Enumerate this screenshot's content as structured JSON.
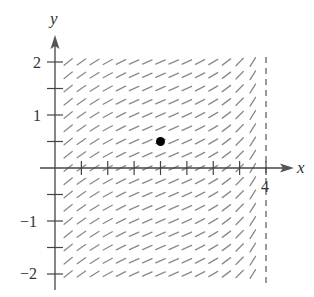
{
  "chart_data": {
    "type": "slope_field",
    "title": "",
    "xlabel": "x",
    "ylabel": "y",
    "x_ticks": {
      "positions": [
        0.5,
        1,
        1.5,
        2,
        2.5,
        3,
        3.5,
        4
      ],
      "labels": [
        {
          "value": 4,
          "text": "4"
        }
      ]
    },
    "y_ticks": {
      "positions": [
        2,
        1.5,
        1,
        0.5,
        -0.5,
        -1,
        -1.5,
        -2
      ],
      "labels": [
        {
          "value": 2,
          "text": "2"
        },
        {
          "value": 1,
          "text": "1"
        },
        {
          "value": -1,
          "text": "−1"
        },
        {
          "value": -2,
          "text": "−2"
        }
      ]
    },
    "xlim": [
      0,
      4.5
    ],
    "ylim": [
      -2,
      2
    ],
    "grid": false,
    "field": {
      "x_values": [
        0.25,
        0.5,
        0.75,
        1.0,
        1.25,
        1.5,
        1.75,
        2.0,
        2.25,
        2.5,
        2.75,
        3.0,
        3.25,
        3.5,
        3.75
      ],
      "y_values": [
        2,
        1.75,
        1.5,
        1.25,
        1,
        0.75,
        0.5,
        0.25,
        0,
        -0.25,
        -0.5,
        -0.75,
        -1,
        -1.25,
        -1.5,
        -1.75,
        -2
      ],
      "slopes_by_x": [
        0.8,
        0.7,
        0.62,
        0.55,
        0.5,
        0.46,
        0.44,
        0.43,
        0.44,
        0.47,
        0.52,
        0.6,
        0.75,
        1.0,
        1.6
      ]
    },
    "asymptote": {
      "type": "vertical",
      "x": 4,
      "style": "dashed"
    },
    "points": [
      {
        "x": 2,
        "y": 0.5,
        "label": ""
      }
    ]
  },
  "axes": {
    "x_label": "x",
    "y_label": "y",
    "x_tick_label_4": "4",
    "y_tick_label_2": "2",
    "y_tick_label_1": "1",
    "y_tick_label_m1": "−1",
    "y_tick_label_m2": "−2"
  }
}
